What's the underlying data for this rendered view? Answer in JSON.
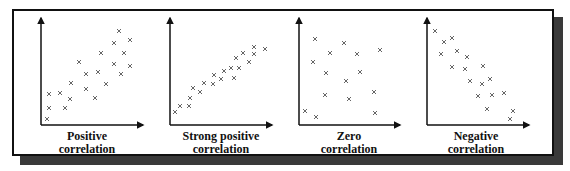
{
  "figure": {
    "title": "",
    "marker": "×",
    "colors": {
      "axis": "#111111",
      "marker": "#555555",
      "frame": "#111111",
      "shadow": "#3a3a3a"
    }
  },
  "panels": [
    {
      "label_line1": "Positive",
      "label_line2": "correlation"
    },
    {
      "label_line1": "Strong positive",
      "label_line2": "correlation"
    },
    {
      "label_line1": "Zero",
      "label_line2": "correlation"
    },
    {
      "label_line1": "Negative",
      "label_line2": "correlation"
    }
  ],
  "chart_data": [
    {
      "type": "scatter",
      "title": "Positive correlation",
      "xlabel": "",
      "ylabel": "",
      "axes": {
        "origin": [
          41,
          125
        ],
        "x_end": 143,
        "y_end": 18
      },
      "points": [
        [
          47,
          119
        ],
        [
          49,
          108
        ],
        [
          65,
          108
        ],
        [
          49,
          94
        ],
        [
          60,
          93
        ],
        [
          70,
          99
        ],
        [
          71,
          83
        ],
        [
          79,
          62
        ],
        [
          86,
          74
        ],
        [
          86,
          89
        ],
        [
          95,
          98
        ],
        [
          98,
          72
        ],
        [
          101,
          53
        ],
        [
          106,
          84
        ],
        [
          114,
          43
        ],
        [
          119,
          31
        ],
        [
          130,
          40
        ],
        [
          124,
          53
        ],
        [
          114,
          64
        ],
        [
          121,
          74
        ],
        [
          130,
          66
        ]
      ]
    },
    {
      "type": "scatter",
      "title": "Strong positive correlation",
      "xlabel": "",
      "ylabel": "",
      "axes": {
        "origin": [
          170,
          125
        ],
        "x_end": 272,
        "y_end": 18
      },
      "points": [
        [
          175,
          112
        ],
        [
          180,
          106
        ],
        [
          189,
          106
        ],
        [
          190,
          98
        ],
        [
          193,
          88
        ],
        [
          200,
          92
        ],
        [
          204,
          83
        ],
        [
          213,
          84
        ],
        [
          214,
          75
        ],
        [
          221,
          79
        ],
        [
          224,
          71
        ],
        [
          231,
          68
        ],
        [
          234,
          78
        ],
        [
          239,
          68
        ],
        [
          236,
          58
        ],
        [
          243,
          53
        ],
        [
          249,
          62
        ],
        [
          254,
          47
        ],
        [
          254,
          54
        ],
        [
          265,
          49
        ]
      ]
    },
    {
      "type": "scatter",
      "title": "Zero correlation",
      "xlabel": "",
      "ylabel": "",
      "axes": {
        "origin": [
          299,
          125
        ],
        "x_end": 400,
        "y_end": 18
      },
      "points": [
        [
          315,
          39
        ],
        [
          344,
          43
        ],
        [
          330,
          53
        ],
        [
          357,
          54
        ],
        [
          380,
          50
        ],
        [
          313,
          62
        ],
        [
          326,
          73
        ],
        [
          360,
          72
        ],
        [
          346,
          81
        ],
        [
          325,
          95
        ],
        [
          349,
          99
        ],
        [
          374,
          92
        ],
        [
          305,
          111
        ],
        [
          316,
          117
        ],
        [
          375,
          113
        ]
      ]
    },
    {
      "type": "scatter",
      "title": "Negative correlation",
      "xlabel": "",
      "ylabel": "",
      "axes": {
        "origin": [
          427,
          125
        ],
        "x_end": 529,
        "y_end": 18
      },
      "points": [
        [
          435,
          31
        ],
        [
          444,
          42
        ],
        [
          452,
          38
        ],
        [
          441,
          54
        ],
        [
          457,
          51
        ],
        [
          467,
          57
        ],
        [
          452,
          67
        ],
        [
          465,
          69
        ],
        [
          483,
          66
        ],
        [
          470,
          81
        ],
        [
          482,
          84
        ],
        [
          490,
          79
        ],
        [
          478,
          96
        ],
        [
          492,
          95
        ],
        [
          504,
          93
        ],
        [
          487,
          109
        ],
        [
          513,
          111
        ],
        [
          510,
          119
        ]
      ]
    }
  ]
}
